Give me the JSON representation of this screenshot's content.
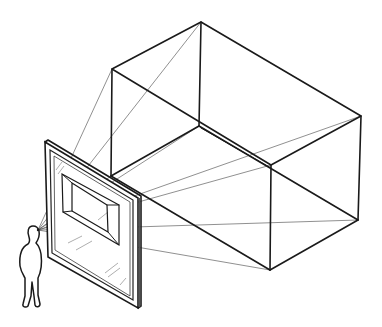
{
  "diagram": {
    "title": "Perspective picture plane: viewer looking through a framed glass window at a box",
    "elements": {
      "viewer": "person standing with eye at the station point",
      "picture_plane": "framed glass pane showing projected box",
      "object": "rectangular box (3D) behind the glass",
      "sight_lines": "visual rays from eye to box vertices"
    }
  },
  "colors": {
    "ink": "#1a1a1a",
    "background": "#ffffff"
  }
}
